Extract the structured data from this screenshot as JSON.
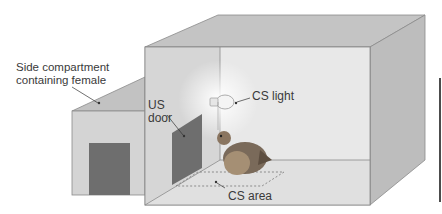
{
  "figure": {
    "labels": {
      "side_compartment_line1": "Side compartment",
      "side_compartment_line2": "containing female",
      "us_door_line1": "US",
      "us_door_line2": "door",
      "cs_light": "CS light",
      "cs_area": "CS area"
    },
    "colors": {
      "box_top": "#c4c4c4",
      "box_right": "#bdbdbd",
      "box_back": "#e4e4e4",
      "box_left_wall": "#d6d6d6",
      "floor": "#e2e2e2",
      "side_front": "#d4d4d4",
      "side_roof": "#c2c2c2",
      "door_dark": "#6e6e6e",
      "outline": "#8a8a8a",
      "quail_body": "#7a6a5a"
    }
  }
}
